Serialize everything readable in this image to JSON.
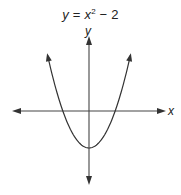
{
  "chart_data": {
    "type": "line",
    "title_parts": {
      "lhs": "y",
      "eq": " = ",
      "var": "x",
      "exp": "2",
      "rest": " − 2"
    },
    "xlabel": "x",
    "ylabel": "y",
    "function": "y = x^2 - 2",
    "vertex": [
      0,
      -2
    ],
    "x_intercepts": [
      -1.414,
      1.414
    ],
    "grid": false,
    "ticks": false,
    "axes_arrows": true,
    "curve_arrows": true,
    "x": [
      -2.24,
      -2,
      -1.5,
      -1.414,
      -1,
      -0.5,
      0,
      0.5,
      1,
      1.414,
      1.5,
      2,
      2.24
    ],
    "y": [
      3.0,
      2.0,
      0.25,
      0,
      -1,
      -1.75,
      -2,
      -1.75,
      -1,
      0,
      0.25,
      2.0,
      3.0
    ],
    "xlim": [
      -4,
      4
    ],
    "ylim": [
      -2.9,
      4
    ]
  },
  "colors": {
    "line": "#333333",
    "axis": "#444444",
    "background": "#ffffff"
  }
}
